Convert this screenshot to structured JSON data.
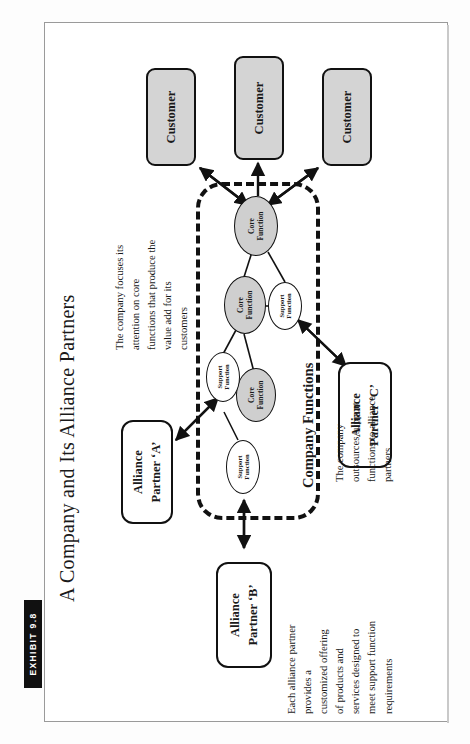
{
  "exhibit": {
    "tag": "EXHIBIT 9.8"
  },
  "title": "A Company and Its Alliance Partners",
  "customers": [
    {
      "label": "Customer"
    },
    {
      "label": "Customer"
    },
    {
      "label": "Customer"
    }
  ],
  "boundary": {
    "label": "Company Functions"
  },
  "functions": [
    {
      "type": "core",
      "line1": "Core",
      "line2": "Function"
    },
    {
      "type": "core",
      "line1": "Core",
      "line2": "Function"
    },
    {
      "type": "core",
      "line1": "Core",
      "line2": "Function"
    },
    {
      "type": "support",
      "line1": "Support",
      "line2": "Function"
    },
    {
      "type": "support",
      "line1": "Support",
      "line2": "Function"
    },
    {
      "type": "support",
      "line1": "Support",
      "line2": "Function"
    }
  ],
  "partners": [
    {
      "line1": "Alliance",
      "line2": "Partner ‘A’"
    },
    {
      "line1": "Alliance",
      "line2": "Partner ‘B’"
    },
    {
      "line1": "Alliance",
      "line2": "Partner ‘C’"
    }
  ],
  "notes": {
    "core_focus": [
      "The company focuses its",
      "attention on core",
      "functions that produce the",
      "value add for its",
      "customers"
    ],
    "outsourcing": [
      "The company",
      "outsources support",
      "functions to alliance",
      "partners"
    ],
    "partner_offering": [
      "Each alliance partner",
      "provides a",
      "customized offering",
      "of products and",
      "services designed to",
      "meet support function",
      "requirements"
    ]
  },
  "colors": {
    "core_fill": "#cfcfcf",
    "customer_fill": "#d4d4d4",
    "stroke": "#111111",
    "tab_bg": "#111111"
  }
}
